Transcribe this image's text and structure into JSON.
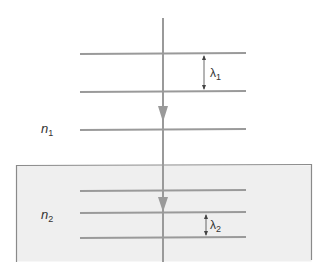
{
  "diagram": {
    "type": "wavefronts-refraction",
    "colors": {
      "line": "#9a9a9a",
      "medium2_fill": "#efefef",
      "medium2_border": "#8a8a8a",
      "dimension": "#444444",
      "text": "#333333"
    },
    "medium1": {
      "label_base": "n",
      "label_sub": "1",
      "wavefronts_y": [
        53,
        92,
        129
      ],
      "wavelength_label_base": "λ",
      "wavelength_label_sub": "1"
    },
    "medium2": {
      "label_base": "n",
      "label_sub": "2",
      "wavefronts_y": [
        191,
        213,
        237
      ],
      "wavelength_label_base": "λ",
      "wavelength_label_sub": "2"
    }
  }
}
